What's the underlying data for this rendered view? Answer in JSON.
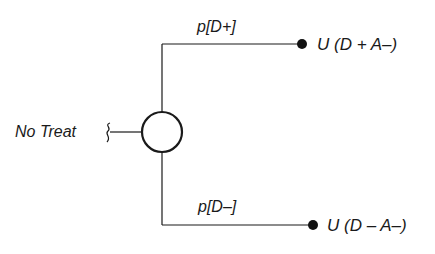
{
  "diagram": {
    "type": "decision-tree",
    "root_label": "No Treat",
    "chance_node": "chance-node",
    "branches": [
      {
        "probability_label": "p[D+]",
        "outcome_label": "U (D + A–)"
      },
      {
        "probability_label": "p[D–]",
        "outcome_label": "U (D – A–)"
      }
    ]
  },
  "colors": {
    "line": "#1a1a1a",
    "background": "#ffffff"
  }
}
